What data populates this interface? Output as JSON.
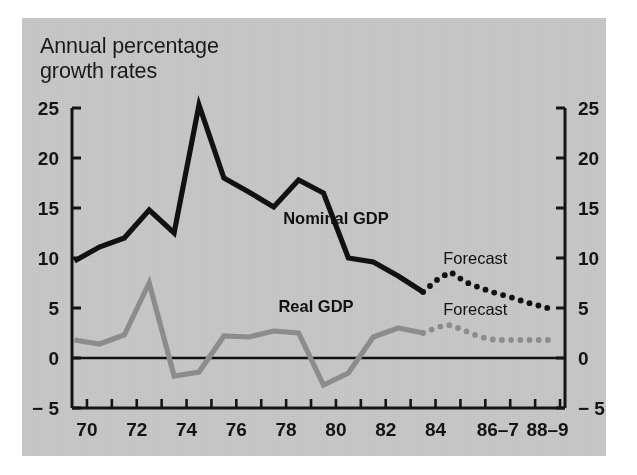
{
  "figure": {
    "title": "Annual percentage\ngrowth rates",
    "panel_color": "#c9c9c9",
    "page_color": "#ffffff"
  },
  "chart_data": {
    "type": "line",
    "title": "Annual percentage growth rates",
    "subtitle": "",
    "xlabel": "",
    "ylabel": "",
    "ylim": [
      -5,
      25
    ],
    "xlim": [
      1969.4,
      1989.2
    ],
    "grid": false,
    "legend": "inline-labels",
    "y_ticks": [
      -5,
      0,
      5,
      10,
      15,
      20,
      25
    ],
    "y_tick_labels_left": [
      "− 5",
      "0",
      "5",
      "10",
      "15",
      "20",
      "25"
    ],
    "y_tick_labels_right": [
      "− 5",
      "0",
      "5",
      "10",
      "15",
      "20",
      "25"
    ],
    "x_ticks": [
      1970,
      1971,
      1972,
      1973,
      1974,
      1975,
      1976,
      1977,
      1978,
      1979,
      1980,
      1981,
      1982,
      1983,
      1984,
      1985,
      1986,
      1987,
      1988,
      1989
    ],
    "x_tick_labels": [
      {
        "x": 1970,
        "label": "70"
      },
      {
        "x": 1972,
        "label": "72"
      },
      {
        "x": 1974,
        "label": "74"
      },
      {
        "x": 1976,
        "label": "76"
      },
      {
        "x": 1978,
        "label": "78"
      },
      {
        "x": 1980,
        "label": "80"
      },
      {
        "x": 1982,
        "label": "82"
      },
      {
        "x": 1984,
        "label": "84"
      },
      {
        "x": 1986.5,
        "label": "86–7"
      },
      {
        "x": 1988.5,
        "label": "88–9"
      }
    ],
    "zero_line": 0,
    "series": [
      {
        "name": "Nominal GDP",
        "color": "#111111",
        "style": "solid",
        "label_text": "Nominal GDP",
        "x": [
          1969.5,
          1970.5,
          1971.5,
          1972.5,
          1973.5,
          1974.5,
          1975.5,
          1976.5,
          1977.5,
          1978.5,
          1979.5,
          1980.5,
          1981.5,
          1982.5,
          1983.5
        ],
        "values": [
          9.7,
          11.1,
          12.0,
          14.8,
          12.5,
          25.3,
          18.0,
          16.6,
          15.1,
          17.8,
          16.5,
          10.0,
          9.6,
          8.2,
          6.6
        ]
      },
      {
        "name": "Nominal GDP Forecast",
        "color": "#111111",
        "style": "dotted",
        "label_text": "Forecast",
        "x": [
          1983.5,
          1984.1,
          1984.6,
          1985.2,
          1985.8,
          1986.4,
          1987.0,
          1987.6,
          1988.2,
          1988.8
        ],
        "values": [
          6.6,
          7.9,
          8.6,
          7.6,
          7.0,
          6.5,
          6.1,
          5.6,
          5.2,
          4.8
        ]
      },
      {
        "name": "Real GDP",
        "color": "#8c8c8c",
        "style": "solid",
        "label_text": "Real GDP",
        "x": [
          1969.5,
          1970.5,
          1971.5,
          1972.5,
          1973.5,
          1974.5,
          1975.5,
          1976.5,
          1977.5,
          1978.5,
          1979.5,
          1980.5,
          1981.5,
          1982.5,
          1983.5
        ],
        "values": [
          1.8,
          1.4,
          2.3,
          7.5,
          -1.8,
          -1.4,
          2.2,
          2.1,
          2.7,
          2.5,
          -2.7,
          -1.5,
          2.1,
          3.0,
          2.5
        ]
      },
      {
        "name": "Real GDP Forecast",
        "color": "#8c8c8c",
        "style": "dotted",
        "label_text": "Forecast",
        "x": [
          1983.5,
          1984.1,
          1984.6,
          1985.2,
          1985.8,
          1986.4,
          1987.0,
          1987.6,
          1988.2,
          1988.8
        ],
        "values": [
          2.5,
          3.1,
          3.3,
          2.7,
          2.1,
          1.8,
          1.8,
          1.8,
          1.8,
          1.8
        ]
      }
    ],
    "annotations": [
      {
        "text": "Nominal GDP",
        "x": 1980.0,
        "y": 13.4,
        "weight": "bold"
      },
      {
        "text": "Real GDP",
        "x": 1979.2,
        "y": 4.6,
        "weight": "bold"
      },
      {
        "text": "Forecast",
        "x": 1985.6,
        "y": 9.4,
        "weight": "normal"
      },
      {
        "text": "Forecast",
        "x": 1985.6,
        "y": 4.3,
        "weight": "normal"
      }
    ]
  }
}
